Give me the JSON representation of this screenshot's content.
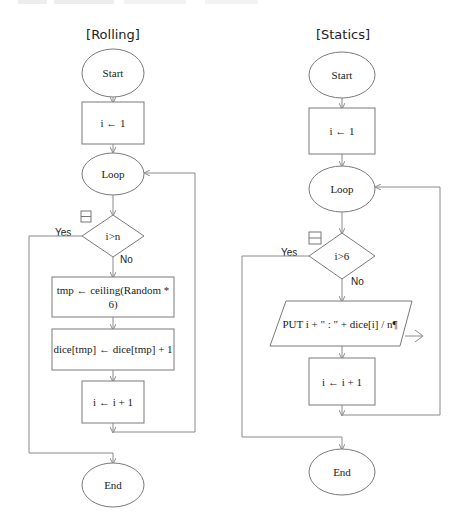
{
  "flowcharts": [
    {
      "title": "[Rolling]",
      "nodes": {
        "start": "Start",
        "init": "i ← 1",
        "loop": "Loop",
        "condition": "i>n",
        "yes": "Yes",
        "no": "No",
        "step1_line1": "tmp ← ceiling(Random *",
        "step1_line2": "6)",
        "step2": "dice[tmp] ← dice[tmp] + 1",
        "increment": "i ← i + 1",
        "end": "End"
      },
      "collapse_icon": "collapse-box-icon"
    },
    {
      "title": "[Statics]",
      "nodes": {
        "start": "Start",
        "init": "i ← 1",
        "loop": "Loop",
        "condition": "i>6",
        "yes": "Yes",
        "no": "No",
        "output": "PUT i + \" : \" + dice[i] / n¶",
        "increment": "i ← i + 1",
        "end": "End"
      },
      "collapse_icon": "collapse-box-icon",
      "output_icon": "output-arrow-icon"
    }
  ]
}
